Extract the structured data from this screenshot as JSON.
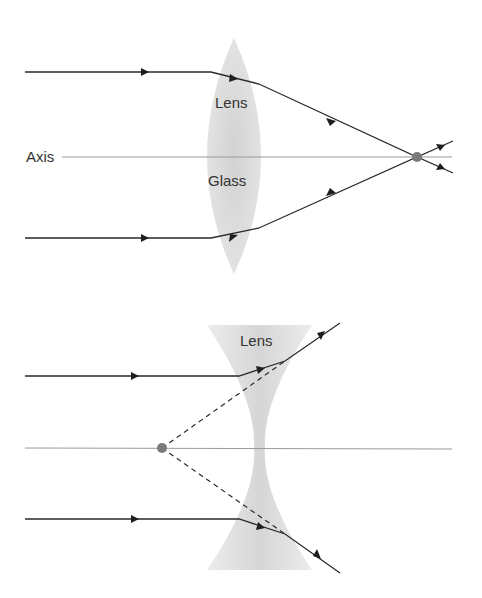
{
  "converging": {
    "axis_label": "Axis",
    "lens_label_1": "Lens",
    "lens_label_2": "Glass"
  },
  "diverging": {
    "lens_label": "Lens"
  },
  "colors": {
    "ray": "#2a2a2a",
    "axis": "#9a9a9a",
    "lens_fill": "#d8d8d8",
    "focal_point": "#7a7a7a"
  }
}
